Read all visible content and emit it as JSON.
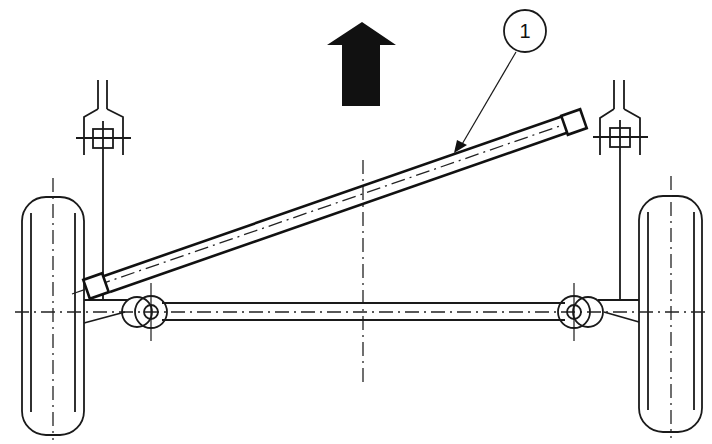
{
  "diagram": {
    "type": "technical-line-drawing",
    "callouts": [
      {
        "id": "1",
        "label": "1",
        "target": "diagonal-rod"
      }
    ],
    "direction_arrow": {
      "meaning": "direction of travel",
      "orientation": "up"
    },
    "colors": {
      "line": "#1a1a1a",
      "background": "#ffffff",
      "arrow_fill": "#111111"
    },
    "components": [
      "left-wheel",
      "right-wheel",
      "left-shock-mount",
      "right-shock-mount",
      "axle-beam",
      "left-bushing",
      "right-bushing",
      "diagonal-rod",
      "vehicle-centerline"
    ]
  }
}
